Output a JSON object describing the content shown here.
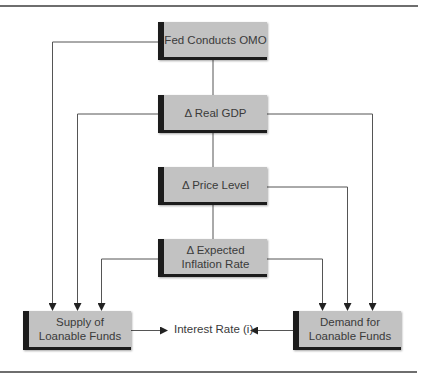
{
  "diagram": {
    "type": "flowchart",
    "nodes": {
      "fed": {
        "label": "Fed Conducts OMO"
      },
      "gdp": {
        "label": "Δ Real GDP"
      },
      "price": {
        "label": "Δ Price Level"
      },
      "inflation": {
        "label": "Δ Expected\nInflation Rate"
      },
      "supply": {
        "label": "Supply of\nLoanable Funds"
      },
      "demand": {
        "label": "Demand for\nLoanable Funds"
      }
    },
    "interest_rate_label": "Interest Rate (i)",
    "edges": [
      {
        "from": "fed",
        "to": "gdp"
      },
      {
        "from": "gdp",
        "to": "price"
      },
      {
        "from": "price",
        "to": "inflation"
      },
      {
        "from": "fed",
        "to": "supply"
      },
      {
        "from": "gdp",
        "to": "supply"
      },
      {
        "from": "inflation",
        "to": "supply"
      },
      {
        "from": "gdp",
        "to": "demand"
      },
      {
        "from": "price",
        "to": "demand"
      },
      {
        "from": "inflation",
        "to": "demand"
      },
      {
        "from": "supply",
        "to": "interest_rate"
      },
      {
        "from": "demand",
        "to": "interest_rate"
      }
    ],
    "colors": {
      "box_fill": "#c2c2c2",
      "box_edge": "#1c1c1c",
      "line": "#555555"
    }
  }
}
